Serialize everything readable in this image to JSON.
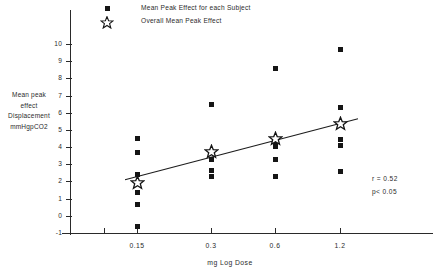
{
  "legend": {
    "items": [
      {
        "icon": "filled-square-marker",
        "label": "Mean Peak Effect for each Subject"
      },
      {
        "icon": "open-star-marker",
        "label": "Overall Mean Peak Effect"
      }
    ]
  },
  "annotations": {
    "correlation": "r = 0.52",
    "significance": "p< 0.05"
  },
  "axis_title_lines": {
    "l0": "Mean peak",
    "l1": "effect",
    "l2": "Displacement",
    "l3": "mmHgpCO2"
  },
  "chart_data": {
    "type": "scatter",
    "title": "",
    "xlabel": "mg Log Dose",
    "ylabel": "Mean peak effect Displacement mmHgpCO2",
    "xtick_labels": [
      "0.15",
      "0.3",
      "0.6",
      "1.2"
    ],
    "xtick_values": [
      0.15,
      0.3,
      0.6,
      1.2
    ],
    "ytick_labels": [
      "10",
      "9",
      "8",
      "7",
      "6",
      "5",
      "4",
      "3",
      "2",
      "1",
      "0",
      "-1"
    ],
    "ylim": [
      -1,
      10
    ],
    "grid": false,
    "legend_position": "top-center",
    "series": [
      {
        "name": "Mean Peak Effect for each Subject",
        "marker": "filled-square",
        "points": [
          {
            "dose": "0.15",
            "value": 4.5
          },
          {
            "dose": "0.15",
            "value": 3.7
          },
          {
            "dose": "0.15",
            "value": 2.4
          },
          {
            "dose": "0.15",
            "value": 1.35
          },
          {
            "dose": "0.15",
            "value": 0.65
          },
          {
            "dose": "0.15",
            "value": -0.65
          },
          {
            "dose": "0.3",
            "value": 6.5
          },
          {
            "dose": "0.3",
            "value": 3.3
          },
          {
            "dose": "0.3",
            "value": 2.65
          },
          {
            "dose": "0.3",
            "value": 2.3
          },
          {
            "dose": "0.6",
            "value": 8.55
          },
          {
            "dose": "0.6",
            "value": 4.4
          },
          {
            "dose": "0.6",
            "value": 4.2
          },
          {
            "dose": "0.6",
            "value": 4.05
          },
          {
            "dose": "0.6",
            "value": 3.25
          },
          {
            "dose": "0.6",
            "value": 2.3
          },
          {
            "dose": "1.2",
            "value": 9.7
          },
          {
            "dose": "1.2",
            "value": 6.3
          },
          {
            "dose": "1.2",
            "value": 4.45
          },
          {
            "dose": "1.2",
            "value": 4.1
          },
          {
            "dose": "1.2",
            "value": 2.6
          }
        ]
      },
      {
        "name": "Overall Mean Peak Effect",
        "marker": "open-star",
        "points": [
          {
            "dose": "0.15",
            "value": 1.95
          },
          {
            "dose": "0.3",
            "value": 3.75
          },
          {
            "dose": "0.6",
            "value": 4.5
          },
          {
            "dose": "1.2",
            "value": 5.4
          }
        ]
      }
    ],
    "trend_line": {
      "name": "regression-line",
      "from": {
        "dose": "0.15",
        "value": 2.1
      },
      "to": {
        "dose": "1.2",
        "value": 5.65
      }
    }
  }
}
